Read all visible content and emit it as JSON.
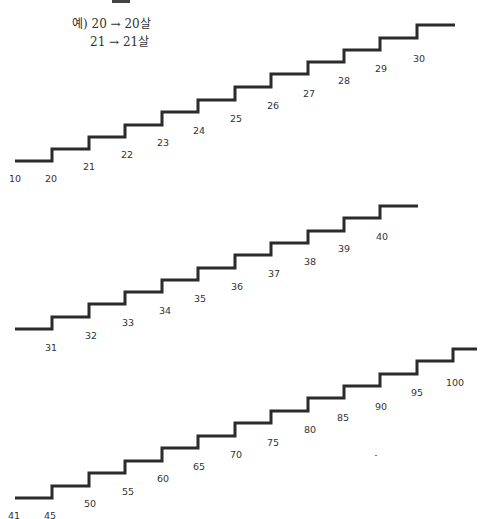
{
  "header": {
    "partial_title": "",
    "example_lines": [
      "예) 20 → 20살",
      "21 → 21살"
    ]
  },
  "colors": {
    "stroke": "#2b2b2b",
    "text": "#333333",
    "background": "#ffffff"
  },
  "staircases": [
    {
      "name": "staircase-1",
      "labels": [
        {
          "text": "10",
          "x": 15,
          "y": 173
        },
        {
          "text": "20",
          "x": 51,
          "y": 173
        },
        {
          "text": "21",
          "x": 89,
          "y": 161
        },
        {
          "text": "22",
          "x": 127,
          "y": 149
        },
        {
          "text": "23",
          "x": 163,
          "y": 137
        },
        {
          "text": "24",
          "x": 199,
          "y": 125
        },
        {
          "text": "25",
          "x": 236,
          "y": 113
        },
        {
          "text": "26",
          "x": 273,
          "y": 100
        },
        {
          "text": "27",
          "x": 309,
          "y": 88
        },
        {
          "text": "28",
          "x": 344,
          "y": 75
        },
        {
          "text": "29",
          "x": 381,
          "y": 63
        },
        {
          "text": "30",
          "x": 419,
          "y": 53
        }
      ]
    },
    {
      "name": "staircase-2",
      "labels": [
        {
          "text": "31",
          "x": 51,
          "y": 342
        },
        {
          "text": "32",
          "x": 91,
          "y": 330
        },
        {
          "text": "33",
          "x": 128,
          "y": 317
        },
        {
          "text": "34",
          "x": 165,
          "y": 305
        },
        {
          "text": "35",
          "x": 200,
          "y": 293
        },
        {
          "text": "36",
          "x": 237,
          "y": 281
        },
        {
          "text": "37",
          "x": 274,
          "y": 268
        },
        {
          "text": "38",
          "x": 310,
          "y": 256
        },
        {
          "text": "39",
          "x": 344,
          "y": 243
        },
        {
          "text": "40",
          "x": 382,
          "y": 231
        }
      ]
    },
    {
      "name": "staircase-3",
      "labels": [
        {
          "text": "41",
          "x": 14,
          "y": 510
        },
        {
          "text": "45",
          "x": 50,
          "y": 510
        },
        {
          "text": "50",
          "x": 90,
          "y": 498
        },
        {
          "text": "55",
          "x": 128,
          "y": 486
        },
        {
          "text": "60",
          "x": 163,
          "y": 473
        },
        {
          "text": "65",
          "x": 199,
          "y": 461
        },
        {
          "text": "70",
          "x": 236,
          "y": 449
        },
        {
          "text": "75",
          "x": 273,
          "y": 437
        },
        {
          "text": "80",
          "x": 310,
          "y": 424
        },
        {
          "text": "85",
          "x": 343,
          "y": 412
        },
        {
          "text": "90",
          "x": 381,
          "y": 401
        },
        {
          "text": "95",
          "x": 417,
          "y": 387
        },
        {
          "text": "100",
          "x": 455,
          "y": 377
        }
      ]
    }
  ]
}
